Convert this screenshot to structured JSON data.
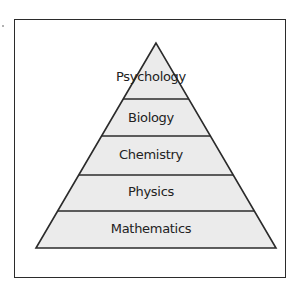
{
  "diagram": {
    "type": "pyramid",
    "fill_color": "#ebebeb",
    "stroke_color": "#2b2b2b",
    "levels": [
      {
        "label": "Psychology"
      },
      {
        "label": "Biology"
      },
      {
        "label": "Chemistry"
      },
      {
        "label": "Physics"
      },
      {
        "label": "Mathematics"
      }
    ]
  }
}
